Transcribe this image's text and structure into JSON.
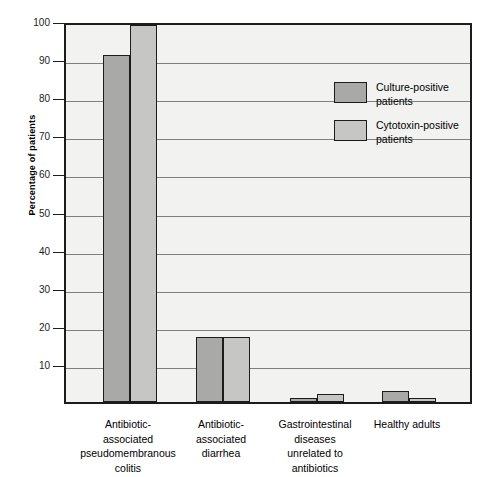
{
  "chart_data": {
    "type": "bar",
    "title": "",
    "xlabel": "",
    "ylabel": "Percentage of patients",
    "ylim": [
      0,
      100
    ],
    "yticks": [
      10,
      20,
      30,
      40,
      50,
      60,
      70,
      80,
      90,
      100
    ],
    "ytick_labels": [
      "10",
      "20",
      "30",
      "40",
      "50",
      "60",
      "70",
      "80",
      "90",
      "100"
    ],
    "grid": true,
    "legend_position": "inside-upper-center-right",
    "categories": [
      "Antibiotic-\nassociated\npseudomembranous\ncolitis",
      "Antibiotic-\nassociated\ndiarrhea",
      "Gastrointestinal\ndiseases\nunrelated to\nantibiotics",
      "Healthy adults"
    ],
    "series": [
      {
        "name": "Culture-positive\npatients",
        "color": "#a9a9a7",
        "values": [
          91,
          17,
          1,
          3
        ]
      },
      {
        "name": "Cytotoxin-positive\npatients",
        "color": "#c6c6c4",
        "values": [
          99,
          17,
          2,
          1
        ]
      }
    ]
  },
  "legend": {
    "entries": [
      {
        "label": "Culture-positive\npatients"
      },
      {
        "label": "Cytotoxin-positive\npatients"
      }
    ]
  },
  "colors": {
    "series_1": "#a9a9a7",
    "series_2": "#c6c6c4",
    "plot_background": "#f2f2f0",
    "axis": "#1c1c1c",
    "gridline": "#808080"
  }
}
